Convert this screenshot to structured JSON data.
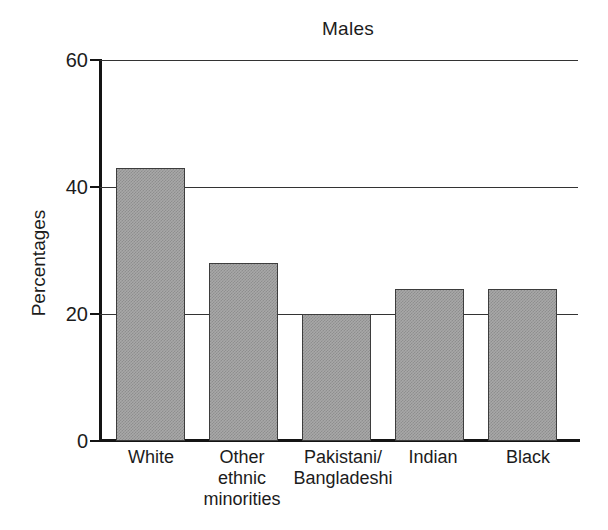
{
  "chart_data": {
    "type": "bar",
    "title": "Males",
    "xlabel": "",
    "ylabel": "Percentages",
    "categories": [
      "White",
      "Other\nethnic\nminorities",
      "Pakistani/\nBangladeshi",
      "Indian",
      "Black"
    ],
    "values": [
      43,
      28,
      20,
      24,
      24
    ],
    "ylim": [
      0,
      60
    ],
    "yticks": [
      0,
      20,
      40,
      60
    ],
    "ytick_labels": [
      "0",
      "20",
      "40",
      "60"
    ],
    "grid": "horizontal gridlines at 20, 40 and 60",
    "legend": "none",
    "bar_fill_color": "#a8a8a8",
    "bar_border_color": "#3d3d3d",
    "axis_color": "#141414"
  },
  "axis": {
    "y_title": "Percentages",
    "ticks": [
      {
        "label": "60",
        "value": 60
      },
      {
        "label": "40",
        "value": 40
      },
      {
        "label": "20",
        "value": 20
      },
      {
        "label": "0",
        "value": 0
      }
    ]
  },
  "bars": [
    {
      "label": "White",
      "value": 43
    },
    {
      "label": "Other\nethnic\nminorities",
      "value": 28
    },
    {
      "label": "Pakistani/\nBangladeshi",
      "value": 20
    },
    {
      "label": "Indian",
      "value": 24
    },
    {
      "label": "Black",
      "value": 24
    }
  ]
}
